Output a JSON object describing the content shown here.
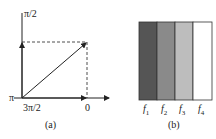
{
  "panel_a": {
    "caption": "(a)",
    "labels": {
      "top": "π/2",
      "left": "π",
      "bottom": "3π/2",
      "right": "0"
    }
  },
  "panel_b": {
    "caption": "(b)",
    "stripes": [
      {
        "label": "f",
        "sub": "1",
        "color": "#555555"
      },
      {
        "label": "f",
        "sub": "2",
        "color": "#8a8a8a"
      },
      {
        "label": "f",
        "sub": "3",
        "color": "#bdbdbd"
      },
      {
        "label": "f",
        "sub": "4",
        "color": "#ffffff"
      }
    ]
  }
}
